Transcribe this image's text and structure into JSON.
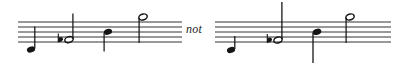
{
  "figure": {
    "name": "music-notation-comparison-figure",
    "background_color": "#ffffff",
    "ink_color": "#1a1a1a",
    "width": 400,
    "height": 63,
    "connector": {
      "label": "not",
      "style": "italic",
      "x": 186,
      "y": 23,
      "font_size": 12
    },
    "staves": [
      {
        "id": "staff-left",
        "label": "correct-example-staff",
        "x": 18,
        "x_end": 182,
        "top_line_y": 22,
        "line_gap": 5.0,
        "line_count": 5,
        "notes": [
          {
            "id": "note-1",
            "name": "quarter-note-low",
            "head": "filled",
            "x": 31,
            "y": 49.5,
            "stem_dir": "up",
            "stem_length": 22,
            "accidental": null,
            "ledger": false
          },
          {
            "id": "note-2",
            "name": "half-note-flat",
            "head": "hollow",
            "x": 69,
            "y": 39.5,
            "stem_dir": "up",
            "stem_length": 26,
            "accidental": "flat",
            "accidental_x": 58,
            "ledger": false
          },
          {
            "id": "note-3",
            "name": "quarter-note-mid",
            "head": "filled",
            "x": 108,
            "y": 32,
            "stem_dir": "down",
            "stem_length": 20,
            "accidental": null,
            "ledger": false
          },
          {
            "id": "note-4",
            "name": "half-note-high",
            "head": "hollow",
            "x": 143,
            "y": 22,
            "stem_dir": "down",
            "stem_length": 24,
            "accidental": null,
            "ledger": false
          }
        ]
      },
      {
        "id": "staff-right",
        "label": "incorrect-example-staff",
        "x": 215,
        "x_end": 391,
        "top_line_y": 22,
        "line_gap": 5.0,
        "line_count": 5,
        "notes": [
          {
            "id": "note-1",
            "name": "quarter-note-low",
            "head": "filled",
            "x": 231,
            "y": 49.5,
            "stem_dir": "up",
            "stem_length": 14,
            "accidental": null,
            "ledger": false
          },
          {
            "id": "note-2",
            "name": "half-note-flat-long-stem",
            "head": "hollow",
            "x": 278,
            "y": 39.5,
            "stem_dir": "up",
            "stem_length": 38,
            "accidental": "flat",
            "accidental_x": 267,
            "ledger": false
          },
          {
            "id": "note-3",
            "name": "quarter-note-mid-long-stem",
            "head": "filled",
            "x": 317,
            "y": 32,
            "stem_dir": "down",
            "stem_length": 33,
            "accidental": null,
            "ledger": false
          },
          {
            "id": "note-4",
            "name": "half-note-high",
            "head": "hollow",
            "x": 350,
            "y": 22,
            "stem_dir": "down",
            "stem_length": 24,
            "accidental": null,
            "ledger": false
          }
        ]
      }
    ]
  }
}
